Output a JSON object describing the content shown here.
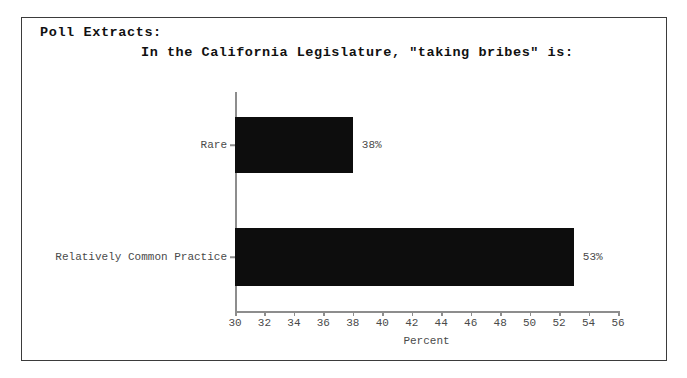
{
  "figure": {
    "extract_label": "Poll Extracts:",
    "title": "In the California Legislature, \"taking bribes\" is:",
    "border_color": "#3b3b3b",
    "background": "#ffffff"
  },
  "chart_data": {
    "type": "bar",
    "orientation": "horizontal",
    "title": "In the California Legislature, \"taking bribes\" is:",
    "xlabel": "Percent",
    "ylabel": "",
    "categories": [
      "Rare",
      "Relatively Common Practice"
    ],
    "values": [
      38,
      53
    ],
    "value_labels": [
      "38%",
      "53%"
    ],
    "xlim": [
      30,
      56
    ],
    "xticks": [
      30,
      32,
      34,
      36,
      38,
      40,
      42,
      44,
      46,
      48,
      50,
      52,
      54,
      56
    ],
    "xtick_labels": [
      "30",
      "32",
      "34",
      "36",
      "38",
      "40",
      "42",
      "44",
      "46",
      "48",
      "50",
      "52",
      "54",
      "56"
    ],
    "grid": false,
    "legend": false,
    "bar_color": "#0d0d0d",
    "axis_color": "#8d8d8d",
    "text_color": "#4a4a4a"
  }
}
